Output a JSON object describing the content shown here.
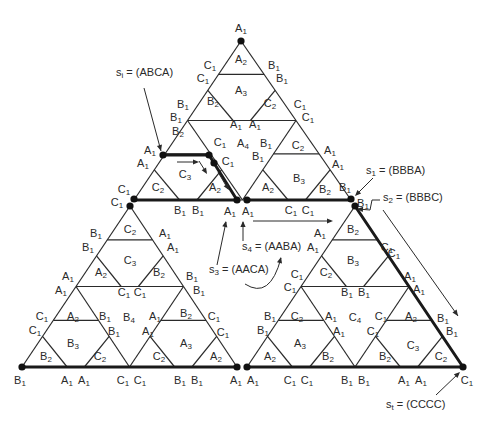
{
  "figure": {
    "outer_triangle": {
      "apex": [
        241,
        41
      ],
      "left": [
        22,
        367
      ],
      "right": [
        463,
        367
      ]
    },
    "sub_triangles": [
      {
        "name": "top",
        "apex": [
          241,
          41
        ],
        "left": [
          134,
          200
        ],
        "right": [
          351,
          200
        ]
      },
      {
        "name": "bottom-left",
        "apex": [
          130,
          206
        ],
        "left": [
          22,
          367
        ],
        "right": [
          237,
          367
        ]
      },
      {
        "name": "bottom-right",
        "apex": [
          355,
          206
        ],
        "left": [
          247,
          367
        ],
        "right": [
          463,
          367
        ]
      }
    ],
    "line_color": "#2a2a2a",
    "thick_path": [
      [
        163,
        155
      ],
      [
        209,
        155
      ],
      [
        214,
        163
      ],
      [
        237,
        200
      ],
      [
        247,
        200
      ],
      [
        351,
        200
      ],
      [
        355,
        206
      ],
      [
        463,
        367
      ]
    ],
    "thick_segments": [
      [
        [
          134,
          200
        ],
        [
          237,
          200
        ]
      ],
      [
        [
          247,
          200
        ],
        [
          351,
          200
        ]
      ],
      [
        [
          22,
          367
        ],
        [
          237,
          367
        ]
      ],
      [
        [
          247,
          367
        ],
        [
          463,
          367
        ]
      ],
      [
        [
          163,
          155
        ],
        [
          209,
          155
        ]
      ],
      [
        [
          209,
          155
        ],
        [
          237,
          200
        ]
      ],
      [
        [
          355,
          206
        ],
        [
          463,
          367
        ]
      ]
    ],
    "dots": [
      [
        241,
        41
      ],
      [
        163,
        155
      ],
      [
        209,
        155
      ],
      [
        214,
        163
      ],
      [
        237,
        200
      ],
      [
        247,
        200
      ],
      [
        134,
        199
      ],
      [
        130,
        206
      ],
      [
        351,
        199
      ],
      [
        355,
        206
      ],
      [
        22,
        367
      ],
      [
        237,
        367
      ],
      [
        247,
        367
      ],
      [
        463,
        367
      ]
    ]
  },
  "cell_labels": [
    {
      "t": "A",
      "s": "2",
      "x": 241,
      "y": 59
    },
    {
      "t": "A",
      "s": "3",
      "x": 241,
      "y": 90
    },
    {
      "t": "B",
      "s": "2",
      "x": 213,
      "y": 101
    },
    {
      "t": "C",
      "s": "2",
      "x": 270,
      "y": 103
    },
    {
      "t": "A",
      "s": "4",
      "x": 243,
      "y": 143
    },
    {
      "t": "B",
      "s": "2",
      "x": 178,
      "y": 131
    },
    {
      "t": "C",
      "s": "2",
      "x": 298,
      "y": 145
    },
    {
      "t": "C",
      "s": "3",
      "x": 185,
      "y": 174
    },
    {
      "t": "A",
      "s": "2",
      "x": 215,
      "y": 187
    },
    {
      "t": "A",
      "s": "2",
      "x": 268,
      "y": 187
    },
    {
      "t": "B",
      "s": "3",
      "x": 299,
      "y": 178
    },
    {
      "t": "B",
      "s": "2",
      "x": 325,
      "y": 189
    },
    {
      "t": "C",
      "s": "2",
      "x": 158,
      "y": 187
    },
    {
      "t": "C",
      "s": "2",
      "x": 130,
      "y": 229
    },
    {
      "t": "C",
      "s": "3",
      "x": 130,
      "y": 260
    },
    {
      "t": "A",
      "s": "2",
      "x": 101,
      "y": 272
    },
    {
      "t": "B",
      "s": "2",
      "x": 159,
      "y": 272
    },
    {
      "t": "A",
      "s": "2",
      "x": 73,
      "y": 316
    },
    {
      "t": "B",
      "s": "4",
      "x": 129,
      "y": 317
    },
    {
      "t": "B",
      "s": "2",
      "x": 186,
      "y": 313
    },
    {
      "t": "B",
      "s": "3",
      "x": 73,
      "y": 343
    },
    {
      "t": "A",
      "s": "3",
      "x": 186,
      "y": 343
    },
    {
      "t": "B",
      "s": "2",
      "x": 46,
      "y": 356
    },
    {
      "t": "C",
      "s": "2",
      "x": 100,
      "y": 356
    },
    {
      "t": "C",
      "s": "2",
      "x": 159,
      "y": 356
    },
    {
      "t": "A",
      "s": "2",
      "x": 216,
      "y": 356
    },
    {
      "t": "B",
      "s": "2",
      "x": 353,
      "y": 229
    },
    {
      "t": "B",
      "s": "3",
      "x": 353,
      "y": 260
    },
    {
      "t": "C",
      "s": "2",
      "x": 326,
      "y": 272
    },
    {
      "t": "C",
      "s": "2",
      "x": 297,
      "y": 316
    },
    {
      "t": "C",
      "s": "4",
      "x": 355,
      "y": 317
    },
    {
      "t": "A",
      "s": "2",
      "x": 411,
      "y": 316
    },
    {
      "t": "A",
      "s": "3",
      "x": 300,
      "y": 343
    },
    {
      "t": "C",
      "s": "3",
      "x": 413,
      "y": 345
    },
    {
      "t": "A",
      "s": "2",
      "x": 270,
      "y": 356
    },
    {
      "t": "B",
      "s": "2",
      "x": 328,
      "y": 356
    },
    {
      "t": "B",
      "s": "2",
      "x": 385,
      "y": 356
    },
    {
      "t": "C",
      "s": "2",
      "x": 441,
      "y": 356
    }
  ],
  "edge_labels": [
    {
      "t": "A",
      "s": "1",
      "x": 241,
      "y": 28
    },
    {
      "t": "C",
      "s": "1",
      "x": 210,
      "y": 65
    },
    {
      "t": "B",
      "s": "1",
      "x": 274,
      "y": 65
    },
    {
      "t": "C",
      "s": "1",
      "x": 203,
      "y": 78
    },
    {
      "t": "B",
      "s": "1",
      "x": 282,
      "y": 78
    },
    {
      "t": "B",
      "s": "1",
      "x": 183,
      "y": 104
    },
    {
      "t": "C",
      "s": "1",
      "x": 300,
      "y": 104
    },
    {
      "t": "B",
      "s": "1",
      "x": 176,
      "y": 117
    },
    {
      "t": "C",
      "s": "1",
      "x": 308,
      "y": 117
    },
    {
      "t": "A",
      "s": "1",
      "x": 236,
      "y": 124
    },
    {
      "t": "A",
      "s": "1",
      "x": 255,
      "y": 124
    },
    {
      "t": "C",
      "s": "1",
      "x": 220,
      "y": 142
    },
    {
      "t": "B",
      "s": "1",
      "x": 266,
      "y": 143
    },
    {
      "t": "B",
      "s": "1",
      "x": 258,
      "y": 156
    },
    {
      "t": "C",
      "s": "1",
      "x": 228,
      "y": 161
    },
    {
      "t": "A",
      "s": "1",
      "x": 150,
      "y": 150
    },
    {
      "t": "A",
      "s": "1",
      "x": 143,
      "y": 163
    },
    {
      "t": "A",
      "s": "1",
      "x": 330,
      "y": 150
    },
    {
      "t": "A",
      "s": "1",
      "x": 338,
      "y": 164
    },
    {
      "t": "C",
      "s": "1",
      "x": 124,
      "y": 189
    },
    {
      "t": "C",
      "s": "1",
      "x": 117,
      "y": 202
    },
    {
      "t": "B",
      "s": "1",
      "x": 345,
      "y": 187
    },
    {
      "t": "B",
      "s": "1",
      "x": 363,
      "y": 203
    },
    {
      "t": "B",
      "s": "1",
      "x": 180,
      "y": 210
    },
    {
      "t": "B",
      "s": "1",
      "x": 198,
      "y": 210
    },
    {
      "t": "A",
      "s": "1",
      "x": 230,
      "y": 211
    },
    {
      "t": "A",
      "s": "1",
      "x": 248,
      "y": 211
    },
    {
      "t": "C",
      "s": "1",
      "x": 291,
      "y": 210
    },
    {
      "t": "C",
      "s": "1",
      "x": 308,
      "y": 210
    },
    {
      "t": "B",
      "s": "1",
      "x": 96,
      "y": 233
    },
    {
      "t": "A",
      "s": "1",
      "x": 165,
      "y": 233
    },
    {
      "t": "B",
      "s": "1",
      "x": 88,
      "y": 247
    },
    {
      "t": "A",
      "s": "1",
      "x": 173,
      "y": 247
    },
    {
      "t": "A",
      "s": "1",
      "x": 68,
      "y": 276
    },
    {
      "t": "B",
      "s": "1",
      "x": 192,
      "y": 276
    },
    {
      "t": "A",
      "s": "1",
      "x": 61,
      "y": 290
    },
    {
      "t": "B",
      "s": "1",
      "x": 199,
      "y": 290
    },
    {
      "t": "C",
      "s": "1",
      "x": 124,
      "y": 292
    },
    {
      "t": "C",
      "s": "1",
      "x": 140,
      "y": 292
    },
    {
      "t": "C",
      "s": "1",
      "x": 42,
      "y": 316
    },
    {
      "t": "B",
      "s": "1",
      "x": 105,
      "y": 316
    },
    {
      "t": "A",
      "s": "1",
      "x": 155,
      "y": 316
    },
    {
      "t": "C",
      "s": "1",
      "x": 214,
      "y": 316
    },
    {
      "t": "C",
      "s": "1",
      "x": 35,
      "y": 330
    },
    {
      "t": "B",
      "s": "1",
      "x": 114,
      "y": 331
    },
    {
      "t": "A",
      "s": "1",
      "x": 148,
      "y": 331
    },
    {
      "t": "C",
      "s": "1",
      "x": 223,
      "y": 332
    },
    {
      "t": "B",
      "s": "1",
      "x": 20,
      "y": 380
    },
    {
      "t": "A",
      "s": "1",
      "x": 67,
      "y": 380
    },
    {
      "t": "A",
      "s": "1",
      "x": 84,
      "y": 380
    },
    {
      "t": "C",
      "s": "1",
      "x": 123,
      "y": 380
    },
    {
      "t": "C",
      "s": "1",
      "x": 140,
      "y": 380
    },
    {
      "t": "B",
      "s": "1",
      "x": 180,
      "y": 380
    },
    {
      "t": "B",
      "s": "1",
      "x": 197,
      "y": 380
    },
    {
      "t": "A",
      "s": "1",
      "x": 236,
      "y": 380
    },
    {
      "t": "A",
      "s": "1",
      "x": 253,
      "y": 380
    },
    {
      "t": "C",
      "s": "1",
      "x": 290,
      "y": 380
    },
    {
      "t": "C",
      "s": "1",
      "x": 307,
      "y": 380
    },
    {
      "t": "B",
      "s": "1",
      "x": 347,
      "y": 380
    },
    {
      "t": "B",
      "s": "1",
      "x": 364,
      "y": 380
    },
    {
      "t": "A",
      "s": "1",
      "x": 404,
      "y": 380
    },
    {
      "t": "A",
      "s": "1",
      "x": 421,
      "y": 380
    },
    {
      "t": "C",
      "s": "1",
      "x": 467,
      "y": 380
    },
    {
      "t": "A",
      "s": "1",
      "x": 320,
      "y": 233
    },
    {
      "t": "C",
      "s": "1",
      "x": 387,
      "y": 247
    },
    {
      "t": "A",
      "s": "1",
      "x": 313,
      "y": 247
    },
    {
      "t": "C",
      "s": "1",
      "x": 394,
      "y": 253
    },
    {
      "t": "C",
      "s": "1",
      "x": 297,
      "y": 274
    },
    {
      "t": "A",
      "s": "1",
      "x": 410,
      "y": 276
    },
    {
      "t": "C",
      "s": "1",
      "x": 290,
      "y": 287
    },
    {
      "t": "A",
      "s": "1",
      "x": 419,
      "y": 289
    },
    {
      "t": "B",
      "s": "1",
      "x": 347,
      "y": 292
    },
    {
      "t": "B",
      "s": "1",
      "x": 364,
      "y": 292
    },
    {
      "t": "B",
      "s": "1",
      "x": 270,
      "y": 316
    },
    {
      "t": "A",
      "s": "1",
      "x": 331,
      "y": 316
    },
    {
      "t": "C",
      "s": "1",
      "x": 381,
      "y": 316
    },
    {
      "t": "B",
      "s": "1",
      "x": 443,
      "y": 318
    },
    {
      "t": "B",
      "s": "1",
      "x": 263,
      "y": 330
    },
    {
      "t": "A",
      "s": "1",
      "x": 339,
      "y": 331
    },
    {
      "t": "C",
      "s": "1",
      "x": 373,
      "y": 331
    },
    {
      "t": "B",
      "s": "1",
      "x": 452,
      "y": 331
    }
  ],
  "states": [
    {
      "name": "s-i",
      "sym": "s",
      "sub": "i",
      "text": " = (ABCA)",
      "x": 116,
      "y": 73
    },
    {
      "name": "s-1",
      "sym": "s",
      "sub": "1",
      "text": " = (BBBA)",
      "x": 366,
      "y": 171
    },
    {
      "name": "s-2",
      "sym": "s",
      "sub": "2",
      "text": " = (BBBC)",
      "x": 383,
      "y": 198
    },
    {
      "name": "s-4",
      "sym": "s",
      "sub": "4",
      "text": " = (AABA)",
      "x": 242,
      "y": 247
    },
    {
      "name": "s-3",
      "sym": "s",
      "sub": "3",
      "text": " = (AACA)",
      "x": 209,
      "y": 270
    },
    {
      "name": "s-t",
      "sym": "s",
      "sub": "t",
      "text": " = (CCCC)",
      "x": 386,
      "y": 405
    }
  ],
  "arrows": [
    {
      "name": "s-i-pointer",
      "d": "M144,88 L161,151",
      "head": [
        161,
        151
      ]
    },
    {
      "name": "path-arrow-1",
      "d": "M177,162 L197,162",
      "head": [
        199,
        162
      ]
    },
    {
      "name": "path-arrow-2",
      "d": "M199,161 L206,172",
      "head": [
        207,
        174
      ]
    },
    {
      "name": "path-arrow-3",
      "d": "M218,172 L228,189",
      "head": [
        229,
        190
      ]
    },
    {
      "name": "s-1-pointer",
      "d": "M373,178 L356,195",
      "head": [
        355,
        196
      ]
    },
    {
      "name": "s-2-pointer",
      "d": "M380,200 L372,200 L370,210 L358,209",
      "head": [
        357,
        209
      ]
    },
    {
      "name": "long-arrow",
      "d": "M383,210 L458,316",
      "head": [
        458,
        316
      ]
    },
    {
      "name": "s-3-pointer",
      "d": "M217,265 L226,222",
      "head": [
        226,
        221
      ]
    },
    {
      "name": "s-4-pointer",
      "d": "M243,241 L243,222",
      "head": [
        243,
        221
      ]
    },
    {
      "name": "center-right-arrow",
      "d": "M253,221 L331,221",
      "head": [
        333,
        221
      ]
    },
    {
      "name": "s-3-curve",
      "d": "M245,284 Q270,300 281,258",
      "head": [
        281,
        257
      ]
    },
    {
      "name": "s-t-pointer",
      "d": "M436,395 L459,373",
      "head": [
        460,
        372
      ]
    }
  ]
}
